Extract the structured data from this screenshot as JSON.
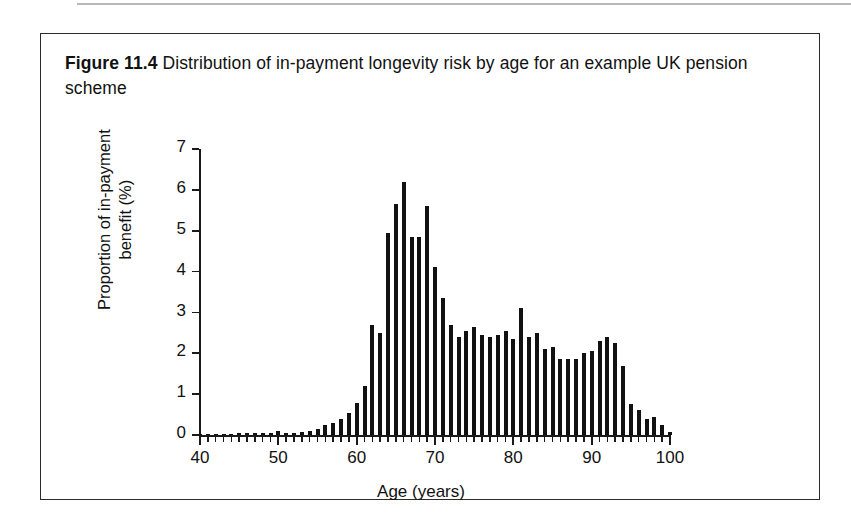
{
  "caption": {
    "label": "Figure 11.4",
    "text": "Distribution of in-payment longevity risk by age for an example UK pension scheme"
  },
  "chart_data": {
    "type": "bar",
    "title": "Distribution of in-payment longevity risk by age for an example UK pension scheme",
    "xlabel": "Age (years)",
    "ylabel": "Proportion of in-payment\nbenefit (%)",
    "xlim": [
      40,
      100
    ],
    "ylim": [
      0,
      7
    ],
    "y_ticks": [
      0,
      1,
      2,
      3,
      4,
      5,
      6,
      7
    ],
    "x_ticks": [
      40,
      50,
      60,
      70,
      80,
      90,
      100
    ],
    "x_tick_interval_minor": 1,
    "grid": false,
    "legend": null,
    "bar_color": "#111111",
    "categories": [
      40,
      41,
      42,
      43,
      44,
      45,
      46,
      47,
      48,
      49,
      50,
      51,
      52,
      53,
      54,
      55,
      56,
      57,
      58,
      59,
      60,
      61,
      62,
      63,
      64,
      65,
      66,
      67,
      68,
      69,
      70,
      71,
      72,
      73,
      74,
      75,
      76,
      77,
      78,
      79,
      80,
      81,
      82,
      83,
      84,
      85,
      86,
      87,
      88,
      89,
      90,
      91,
      92,
      93,
      94,
      95,
      96,
      97,
      98,
      99,
      100
    ],
    "values": [
      0.02,
      0.02,
      0.03,
      0.03,
      0.03,
      0.04,
      0.04,
      0.05,
      0.05,
      0.06,
      0.09,
      0.06,
      0.06,
      0.07,
      0.1,
      0.14,
      0.25,
      0.3,
      0.38,
      0.55,
      0.78,
      1.2,
      2.7,
      2.5,
      4.95,
      5.65,
      6.2,
      4.85,
      4.85,
      5.6,
      4.1,
      3.35,
      2.7,
      2.4,
      2.55,
      2.65,
      2.45,
      2.4,
      2.45,
      2.55,
      2.35,
      3.1,
      2.4,
      2.5,
      2.1,
      2.15,
      1.85,
      1.85,
      1.85,
      2.0,
      2.05,
      2.3,
      2.4,
      2.25,
      1.7,
      0.75,
      0.6,
      0.4,
      0.45,
      0.25,
      0.08
    ]
  },
  "axes": {
    "y_title_line1": "Proportion of in-payment",
    "y_title_line2": "benefit (%)",
    "x_title": "Age (years)"
  }
}
